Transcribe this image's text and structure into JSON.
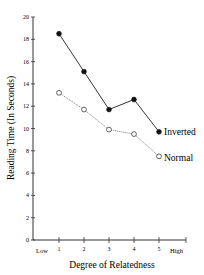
{
  "chart_data": {
    "type": "line",
    "title": "",
    "xlabel": "Degree of Relatedness",
    "ylabel": "Reading Time (In Seconds)",
    "x": [
      1,
      2,
      3,
      4,
      5
    ],
    "x_tick_labels": [
      "1",
      "2",
      "3",
      "4",
      "5"
    ],
    "x_end_labels": {
      "low": "Low",
      "high": "High"
    },
    "y_ticks": [
      0,
      2,
      4,
      6,
      8,
      10,
      12,
      14,
      16,
      18,
      20
    ],
    "ylim": [
      0,
      20
    ],
    "grid": false,
    "legend_position": "inline-right",
    "series": [
      {
        "name": "Inverted",
        "marker": "filled-circle",
        "line": "solid",
        "values": [
          18.5,
          15.1,
          11.7,
          12.6,
          9.7
        ]
      },
      {
        "name": "Normal",
        "marker": "open-circle",
        "line": "dotted",
        "values": [
          13.2,
          11.7,
          9.9,
          9.5,
          7.5
        ]
      }
    ]
  },
  "labels": {
    "ylabel": "Reading Time (In Seconds)",
    "xlabel": "Degree of Relatedness",
    "low": "Low",
    "high": "High",
    "inverted": "Inverted",
    "normal": "Normal"
  }
}
